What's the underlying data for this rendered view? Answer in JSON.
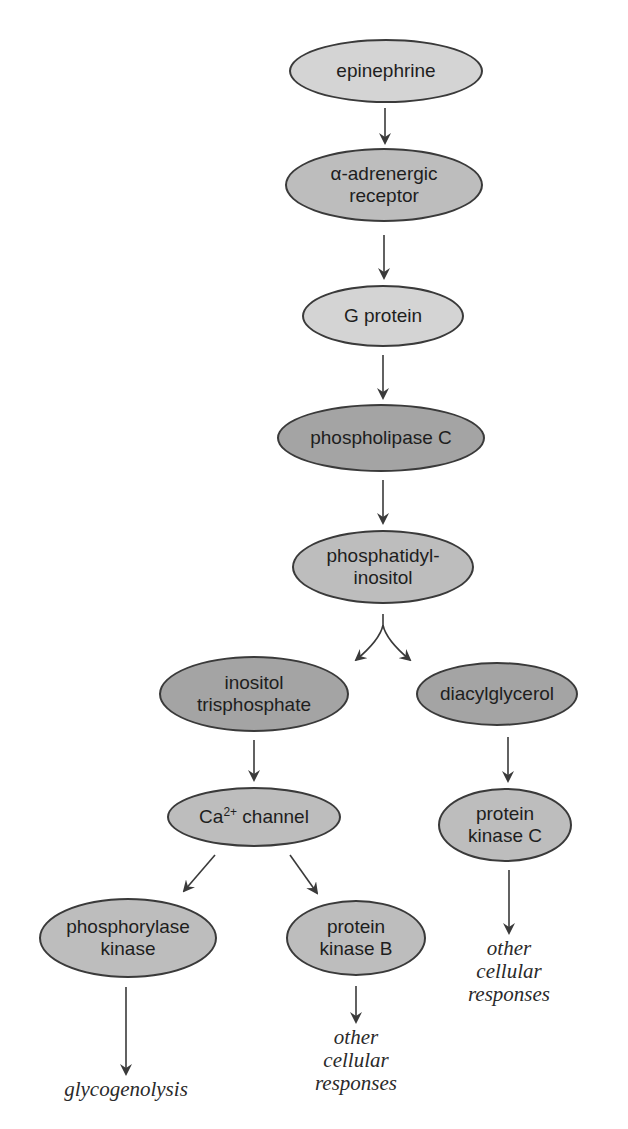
{
  "diagram": {
    "type": "signaling-pathway",
    "nodes": {
      "epinephrine": {
        "line1": "epinephrine"
      },
      "alpha_receptor": {
        "line1": "α-adrenergic",
        "line2": "receptor"
      },
      "g_protein": {
        "line1": "G protein"
      },
      "phospholipase_c": {
        "line1": "phospholipase C"
      },
      "phosphatidylinositol": {
        "line1": "phosphatidyl-",
        "line2": "inositol"
      },
      "inositol_trisphosphate": {
        "line1": "inositol",
        "line2": "trisphosphate"
      },
      "diacylglycerol": {
        "line1": "diacylglycerol"
      },
      "ca_channel": {
        "prefix": "Ca",
        "superscript": "2+",
        "suffix": " channel"
      },
      "protein_kinase_c": {
        "line1": "protein",
        "line2": "kinase C"
      },
      "phosphorylase_kinase": {
        "line1": "phosphorylase",
        "line2": "kinase"
      },
      "protein_kinase_b": {
        "line1": "protein",
        "line2": "kinase B"
      }
    },
    "outcomes": {
      "glycogenolysis": {
        "line1": "glycogenolysis"
      },
      "other_responses_b": {
        "line1": "other",
        "line2": "cellular",
        "line3": "responses"
      },
      "other_responses_c": {
        "line1": "other",
        "line2": "cellular",
        "line3": "responses"
      }
    },
    "edges": [
      [
        "epinephrine",
        "alpha_receptor"
      ],
      [
        "alpha_receptor",
        "g_protein"
      ],
      [
        "g_protein",
        "phospholipase_c"
      ],
      [
        "phospholipase_c",
        "phosphatidylinositol"
      ],
      [
        "phosphatidylinositol",
        "inositol_trisphosphate"
      ],
      [
        "phosphatidylinositol",
        "diacylglycerol"
      ],
      [
        "inositol_trisphosphate",
        "ca_channel"
      ],
      [
        "diacylglycerol",
        "protein_kinase_c"
      ],
      [
        "ca_channel",
        "phosphorylase_kinase"
      ],
      [
        "ca_channel",
        "protein_kinase_b"
      ],
      [
        "phosphorylase_kinase",
        "glycogenolysis"
      ],
      [
        "protein_kinase_b",
        "other_responses_b"
      ],
      [
        "protein_kinase_c",
        "other_responses_c"
      ]
    ],
    "colors": {
      "light_fill": "#d4d4d4",
      "mid_fill": "#bdbdbd",
      "dark_fill": "#a4a4a4",
      "stroke": "#3a3a3a"
    }
  }
}
